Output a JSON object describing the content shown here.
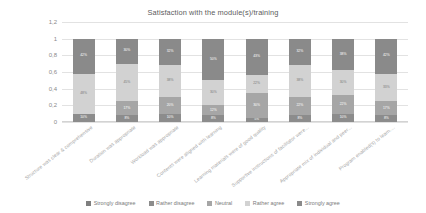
{
  "chart_data": {
    "type": "bar",
    "stacked": true,
    "orientation": "vertical",
    "title": "Satisfaction with the module(s)/training",
    "xlabel": "",
    "ylabel": "",
    "ylim": [
      0,
      1.2
    ],
    "ytick_labels": [
      "1,2",
      "1",
      "0,8",
      "0,6",
      "0,4",
      "0,2",
      "0"
    ],
    "ytick_values": [
      1.2,
      1.0,
      0.8,
      0.6,
      0.4,
      0.2,
      0.0
    ],
    "grid": true,
    "legend_position": "bottom",
    "categories": [
      "Structure was clear & comprehensive",
      "Duration was appropriate",
      "Workload was appropriate",
      "Contents were aligned with learning",
      "Learning materials were of good quality",
      "Supportive instructions of facilitator were...",
      "Appropriate mix of individual and peer...",
      "Program enabled(s) to learn...."
    ],
    "series": [
      {
        "name": "Strongly disagree",
        "color": "#7f7f7f",
        "values": [
          0.0,
          0.0,
          0.0,
          0.0,
          0.0,
          0.0,
          0.0,
          0.0
        ]
      },
      {
        "name": "Rather disagree",
        "color": "#8c8c8c",
        "values": [
          0.1,
          0.08,
          0.1,
          0.08,
          0.05,
          0.08,
          0.1,
          0.08
        ]
      },
      {
        "name": "Neutral",
        "color": "#a6a6a6",
        "values": [
          0.0,
          0.17,
          0.2,
          0.12,
          0.3,
          0.22,
          0.22,
          0.17
        ]
      },
      {
        "name": "Rather agree",
        "color": "#d2d2d2",
        "values": [
          0.48,
          0.45,
          0.38,
          0.3,
          0.22,
          0.38,
          0.3,
          0.33
        ]
      },
      {
        "name": "Strongly agree",
        "color": "#8a8a8a",
        "values": [
          0.42,
          0.3,
          0.32,
          0.5,
          0.43,
          0.32,
          0.38,
          0.42
        ]
      }
    ],
    "bar_labels": [
      [
        "",
        "10%",
        "",
        "48%",
        "42%"
      ],
      [
        "",
        "8%",
        "17%",
        "45%",
        "30%"
      ],
      [
        "",
        "10%",
        "20%",
        "38%",
        "32%"
      ],
      [
        "",
        "8%",
        "12%",
        "30%",
        "50%"
      ],
      [
        "",
        "5%",
        "30%",
        "22%",
        "43%"
      ],
      [
        "",
        "8%",
        "22%",
        "38%",
        "32%"
      ],
      [
        "",
        "10%",
        "22%",
        "30%",
        "38%"
      ],
      [
        "",
        "8%",
        "17%",
        "33%",
        "42%"
      ]
    ]
  }
}
